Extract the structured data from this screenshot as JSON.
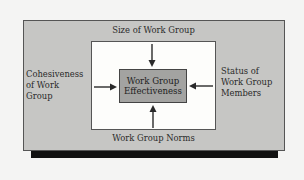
{
  "diagram": {
    "center": {
      "line1": "Work Group",
      "line2": "Effectiveness"
    },
    "factors": {
      "top": "Size of Work Group",
      "bottom": "Work Group Norms",
      "left": {
        "line1": "Cohesiveness",
        "line2": "of Work",
        "line3": "Group"
      },
      "right": {
        "line1": "Status of",
        "line2": "Work Group",
        "line3": "Members"
      }
    },
    "arrows": [
      "top-down",
      "bottom-up",
      "left-right",
      "right-left"
    ],
    "colors": {
      "outer_fill": "#c6c6c4",
      "inner_fill": "#fdfdfb",
      "center_fill": "#a3a3a1",
      "shadow": "#111111",
      "stroke": "#444444"
    }
  }
}
